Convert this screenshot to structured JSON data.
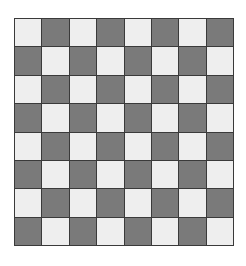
{
  "board": {
    "rows": 8,
    "cols": 8,
    "top_left_color": "light",
    "colors": {
      "light": "#eeeeee",
      "dark": "#7a7a7a",
      "grid_line": "#3a3a3a"
    },
    "pieces": []
  }
}
